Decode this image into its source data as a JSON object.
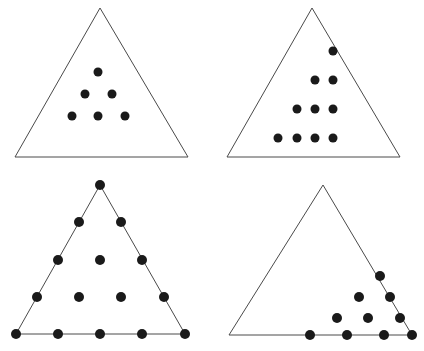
{
  "figure": {
    "background_color": "#ffffff",
    "outline_color": "#4a4a4a",
    "dot_color": "#1a1a1a",
    "panel_count": 4,
    "canvas": {
      "width": 424,
      "height": 351
    }
  },
  "panels": [
    {
      "id": "top-left",
      "name": "panel-top-left",
      "label": "Top-left panel",
      "description": "Centered triangular arrangement of 6 dots inside an empty triangle",
      "dot_count": 6,
      "row_counts": [
        1,
        2,
        3
      ],
      "dot_radius": 4.5,
      "triangle": {
        "apex": [
          100,
          8
        ],
        "left": [
          15,
          157
        ],
        "right": [
          188,
          157
        ],
        "points": "100,8 188,157 15,157"
      },
      "dots": [
        [
          98,
          72
        ],
        [
          85,
          94
        ],
        [
          112,
          94
        ],
        [
          72,
          116
        ],
        [
          98,
          116
        ],
        [
          125,
          116
        ]
      ]
    },
    {
      "id": "top-right",
      "name": "panel-top-right",
      "label": "Top-right panel",
      "description": "Right-aligned triangular arrangement of 10 dots inside an empty triangle",
      "dot_count": 10,
      "row_counts": [
        1,
        2,
        3,
        4
      ],
      "dot_radius": 4.5,
      "triangle": {
        "apex": [
          100,
          8
        ],
        "left": [
          15,
          157
        ],
        "right": [
          188,
          157
        ],
        "points": "100,8 188,157 15,157"
      },
      "dots": [
        [
          121,
          51
        ],
        [
          103,
          80
        ],
        [
          121,
          80
        ],
        [
          85,
          109
        ],
        [
          103,
          109
        ],
        [
          121,
          109
        ],
        [
          66,
          138
        ],
        [
          85,
          138
        ],
        [
          103,
          138
        ],
        [
          121,
          138
        ]
      ]
    },
    {
      "id": "bottom-left",
      "name": "panel-bottom-left",
      "label": "Bottom-left panel",
      "description": "Full triangular lattice of 15 dots with dots on all vertices and edges",
      "dot_count": 15,
      "row_counts": [
        1,
        2,
        3,
        4,
        5
      ],
      "dot_radius": 5,
      "triangle": {
        "apex": [
          100,
          9
        ],
        "left": [
          16,
          158
        ],
        "right": [
          185,
          158
        ],
        "points": "100,9 185,158 16,158"
      },
      "dots": [
        [
          100,
          9
        ],
        [
          79,
          46
        ],
        [
          121,
          46
        ],
        [
          58,
          84
        ],
        [
          100,
          84
        ],
        [
          142,
          84
        ],
        [
          37,
          121
        ],
        [
          79,
          121
        ],
        [
          121,
          121
        ],
        [
          164,
          121
        ],
        [
          16,
          158
        ],
        [
          58,
          158
        ],
        [
          100,
          158
        ],
        [
          142,
          158
        ],
        [
          185,
          158
        ]
      ]
    },
    {
      "id": "bottom-right",
      "name": "panel-bottom-right",
      "label": "Bottom-right panel",
      "description": "Triangular arrangement of 10 dots packed into the lower-right corner of an empty triangle",
      "dot_count": 10,
      "row_counts": [
        1,
        2,
        3,
        4
      ],
      "dot_radius": 5,
      "triangle": {
        "apex": [
          111,
          9
        ],
        "left": [
          17,
          159
        ],
        "right": [
          200,
          159
        ],
        "points": "111,9 200,159 17,159"
      },
      "dots": [
        [
          168,
          100
        ],
        [
          147,
          121
        ],
        [
          178,
          121
        ],
        [
          125,
          142
        ],
        [
          156,
          142
        ],
        [
          188,
          142
        ],
        [
          98,
          159
        ],
        [
          135,
          159
        ],
        [
          172,
          159
        ],
        [
          200,
          159
        ]
      ]
    }
  ]
}
